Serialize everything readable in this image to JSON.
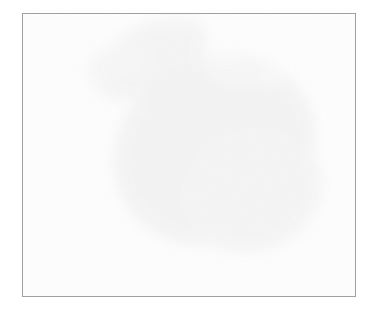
{
  "image": {
    "kind": "micrograph",
    "modality": "brightfield-light-microscopy",
    "stain": "hematoxylin-like grayscale",
    "subject": "epithelial cell cluster (cytology smear)",
    "color_mode": "grayscale",
    "alt_text": "Grayscale light micrograph of a cohesive cluster of epithelial cells with dark round nuclei, oriented diagonally from upper-left to lower-right on a pale empty background.",
    "width_px": 380,
    "height_px": 323
  },
  "frame": {
    "border_color": "#a0a0a0",
    "border_width_px": 1,
    "left_px": 22,
    "top_px": 13,
    "width_px": 334,
    "height_px": 284
  },
  "palette": {
    "page_background": "#ffffff",
    "field_background": "#fdfdfd",
    "haze": "#f2f2f2",
    "cytoplasm_light": "#e4e4e4",
    "cytoplasm_mid": "#c9c9c9",
    "membrane_outline": "#9a9a9a",
    "nucleus_mid": "#8c8c8c",
    "nucleus_dark": "#5e5e5e",
    "nucleus_darkest": "#3a3a3a",
    "speck_black": "#1d1d1d"
  },
  "caption": {
    "line1": "",
    "line2": ""
  },
  "scene": {
    "cluster_orientation": "upper-left to lower-right diagonal",
    "approx_cell_count": 46,
    "free_cells_top_left": 4,
    "notes": "Dense cohesive sheet of polygonal cells; each cell shows one round hyperchromatic nucleus. A short chain of stacked cells trails to the lower left of the mass. Faint granular debris and a small black speck lie near the upper-left free cells."
  },
  "blobs": {
    "haze": [
      {
        "cx": 150,
        "cy": 58,
        "rx": 62,
        "ry": 34,
        "rot": -28,
        "tone": "#f4f4f4"
      },
      {
        "cx": 118,
        "cy": 62,
        "rx": 34,
        "ry": 18,
        "rot": -18,
        "tone": "#f6f6f6"
      },
      {
        "cx": 215,
        "cy": 150,
        "rx": 105,
        "ry": 92,
        "rot": -32,
        "tone": "#f3f3f3"
      },
      {
        "cx": 252,
        "cy": 190,
        "rx": 72,
        "ry": 62,
        "rot": -20,
        "tone": "#f4f4f4"
      },
      {
        "cx": 230,
        "cy": 70,
        "rx": 26,
        "ry": 14,
        "rot": 10,
        "tone": "#f7f7f7"
      },
      {
        "cx": 268,
        "cy": 78,
        "rx": 16,
        "ry": 10,
        "rot": 0,
        "tone": "#f8f8f8"
      }
    ],
    "cells": [
      {
        "cx": 137,
        "cy": 31,
        "rx": 13,
        "ry": 12,
        "rot": 0,
        "cyto": "#dedede",
        "nuc_dx": 0,
        "nuc_dy": 0,
        "nr": 9,
        "nuc": "#8f8f8f",
        "solo": true
      },
      {
        "cx": 153,
        "cy": 62,
        "rx": 14,
        "ry": 13,
        "rot": -12,
        "cyto": "#e0e0e0",
        "nuc_dx": 0,
        "nuc_dy": -1,
        "nr": 9,
        "nuc": "#6f6f6f",
        "solo": true
      },
      {
        "cx": 171,
        "cy": 77,
        "rx": 12,
        "ry": 12,
        "rot": 8,
        "cyto": "#e2e2e2",
        "nuc_dx": -1,
        "nuc_dy": 1,
        "nr": 7,
        "nuc": "#8a8a8a",
        "solo": true
      },
      {
        "cx": 116,
        "cy": 60,
        "rx": 9,
        "ry": 7,
        "rot": -20,
        "cyto": "#ededed",
        "nuc_dx": 0,
        "nuc_dy": 0,
        "nr": 4,
        "nuc": "#b8b8b8",
        "solo": true
      },
      {
        "cx": 185,
        "cy": 93,
        "rx": 15,
        "ry": 14,
        "rot": -16,
        "cyto": "#d8d8d8",
        "nuc_dx": -1,
        "nuc_dy": -1,
        "nr": 8,
        "nuc": "#6a6a6a"
      },
      {
        "cx": 208,
        "cy": 86,
        "rx": 16,
        "ry": 15,
        "rot": 10,
        "cyto": "#dcdcdc",
        "nuc_dx": 1,
        "nuc_dy": 1,
        "nr": 8,
        "nuc": "#636363"
      },
      {
        "cx": 232,
        "cy": 96,
        "rx": 15,
        "ry": 15,
        "rot": -8,
        "cyto": "#dadada",
        "nuc_dx": 0,
        "nuc_dy": 1,
        "nr": 8,
        "nuc": "#5c5c5c"
      },
      {
        "cx": 166,
        "cy": 112,
        "rx": 16,
        "ry": 15,
        "rot": -24,
        "cyto": "#d9d9d9",
        "nuc_dx": -2,
        "nuc_dy": 0,
        "nr": 8,
        "nuc": "#6e6e6e"
      },
      {
        "cx": 191,
        "cy": 115,
        "rx": 16,
        "ry": 16,
        "rot": 6,
        "cyto": "#d5d5d5",
        "nuc_dx": 1,
        "nuc_dy": 0,
        "nr": 9,
        "nuc": "#585858"
      },
      {
        "cx": 215,
        "cy": 112,
        "rx": 15,
        "ry": 15,
        "rot": -6,
        "cyto": "#d9d9d9",
        "nuc_dx": 0,
        "nuc_dy": 1,
        "nr": 8,
        "nuc": "#646464"
      },
      {
        "cx": 240,
        "cy": 118,
        "rx": 16,
        "ry": 15,
        "rot": 14,
        "cyto": "#d7d7d7",
        "nuc_dx": 1,
        "nuc_dy": -1,
        "nr": 8,
        "nuc": "#5a5a5a"
      },
      {
        "cx": 263,
        "cy": 109,
        "rx": 15,
        "ry": 16,
        "rot": -18,
        "cyto": "#dbdbdb",
        "nuc_dx": -1,
        "nuc_dy": 1,
        "nr": 8,
        "nuc": "#636363"
      },
      {
        "cx": 285,
        "cy": 104,
        "rx": 16,
        "ry": 15,
        "rot": 6,
        "cyto": "#d9d9d9",
        "nuc_dx": 0,
        "nuc_dy": 0,
        "nr": 9,
        "nuc": "#555555"
      },
      {
        "cx": 304,
        "cy": 118,
        "rx": 15,
        "ry": 15,
        "rot": -10,
        "cyto": "#dddddd",
        "nuc_dx": 1,
        "nuc_dy": 1,
        "nr": 8,
        "nuc": "#646464"
      },
      {
        "cx": 152,
        "cy": 136,
        "rx": 15,
        "ry": 15,
        "rot": -20,
        "cyto": "#e0e0e0",
        "nuc_dx": -1,
        "nuc_dy": -2,
        "nr": 6,
        "nuc": "#8b8b8b"
      },
      {
        "cx": 176,
        "cy": 139,
        "rx": 16,
        "ry": 15,
        "rot": 4,
        "cyto": "#d6d6d6",
        "nuc_dx": 0,
        "nuc_dy": 1,
        "nr": 9,
        "nuc": "#5b5b5b"
      },
      {
        "cx": 200,
        "cy": 140,
        "rx": 16,
        "ry": 16,
        "rot": -8,
        "cyto": "#d4d4d4",
        "nuc_dx": 1,
        "nuc_dy": 0,
        "nr": 9,
        "nuc": "#525252"
      },
      {
        "cx": 224,
        "cy": 142,
        "rx": 16,
        "ry": 15,
        "rot": 10,
        "cyto": "#d8d8d8",
        "nuc_dx": -1,
        "nuc_dy": 1,
        "nr": 8,
        "nuc": "#5f5f5f"
      },
      {
        "cx": 248,
        "cy": 146,
        "rx": 16,
        "ry": 16,
        "rot": -6,
        "cyto": "#d5d5d5",
        "nuc_dx": 0,
        "nuc_dy": 0,
        "nr": 9,
        "nuc": "#4e4e4e"
      },
      {
        "cx": 272,
        "cy": 140,
        "rx": 15,
        "ry": 15,
        "rot": 16,
        "cyto": "#dbdbdb",
        "nuc_dx": 1,
        "nuc_dy": -1,
        "nr": 8,
        "nuc": "#636363"
      },
      {
        "cx": 295,
        "cy": 145,
        "rx": 16,
        "ry": 16,
        "rot": -12,
        "cyto": "#d9d9d9",
        "nuc_dx": 0,
        "nuc_dy": 1,
        "nr": 9,
        "nuc": "#5a5a5a"
      },
      {
        "cx": 317,
        "cy": 139,
        "rx": 14,
        "ry": 15,
        "rot": 6,
        "cyto": "#dedede",
        "nuc_dx": 0,
        "nuc_dy": 0,
        "nr": 7,
        "nuc": "#6d6d6d"
      },
      {
        "cx": 163,
        "cy": 160,
        "rx": 14,
        "ry": 14,
        "rot": -18,
        "cyto": "#e2e2e2",
        "nuc_dx": -1,
        "nuc_dy": 0,
        "nr": 6,
        "nuc": "#909090"
      },
      {
        "cx": 188,
        "cy": 166,
        "rx": 16,
        "ry": 15,
        "rot": 8,
        "cyto": "#d7d7d7",
        "nuc_dx": 0,
        "nuc_dy": 1,
        "nr": 9,
        "nuc": "#575757"
      },
      {
        "cx": 212,
        "cy": 168,
        "rx": 16,
        "ry": 16,
        "rot": -10,
        "cyto": "#d6d6d6",
        "nuc_dx": 1,
        "nuc_dy": 0,
        "nr": 9,
        "nuc": "#505050"
      },
      {
        "cx": 237,
        "cy": 172,
        "rx": 16,
        "ry": 15,
        "rot": 12,
        "cyto": "#d8d8d8",
        "nuc_dx": -1,
        "nuc_dy": 1,
        "nr": 8,
        "nuc": "#5d5d5d"
      },
      {
        "cx": 262,
        "cy": 170,
        "rx": 16,
        "ry": 16,
        "rot": -8,
        "cyto": "#d4d4d4",
        "nuc_dx": 0,
        "nuc_dy": 0,
        "nr": 9,
        "nuc": "#4a4a4a"
      },
      {
        "cx": 287,
        "cy": 174,
        "rx": 16,
        "ry": 16,
        "rot": 6,
        "cyto": "#d9d9d9",
        "nuc_dx": 1,
        "nuc_dy": 1,
        "nr": 8,
        "nuc": "#5e5e5e"
      },
      {
        "cx": 311,
        "cy": 168,
        "rx": 15,
        "ry": 15,
        "rot": -14,
        "cyto": "#dcdcdc",
        "nuc_dx": 0,
        "nuc_dy": 0,
        "nr": 8,
        "nuc": "#636363"
      },
      {
        "cx": 200,
        "cy": 195,
        "rx": 15,
        "ry": 14,
        "rot": -6,
        "cyto": "#dadada",
        "nuc_dx": 0,
        "nuc_dy": 0,
        "nr": 8,
        "nuc": "#5f5f5f"
      },
      {
        "cx": 226,
        "cy": 198,
        "rx": 15,
        "ry": 15,
        "rot": 10,
        "cyto": "#d7d7d7",
        "nuc_dx": 1,
        "nuc_dy": 1,
        "nr": 8,
        "nuc": "#565656"
      },
      {
        "cx": 252,
        "cy": 200,
        "rx": 16,
        "ry": 16,
        "rot": -12,
        "cyto": "#d5d5d5",
        "nuc_dx": -1,
        "nuc_dy": 0,
        "nr": 9,
        "nuc": "#494949"
      },
      {
        "cx": 278,
        "cy": 200,
        "rx": 16,
        "ry": 16,
        "rot": 8,
        "cyto": "#d8d8d8",
        "nuc_dx": 0,
        "nuc_dy": 1,
        "nr": 9,
        "nuc": "#525252"
      },
      {
        "cx": 303,
        "cy": 196,
        "rx": 15,
        "ry": 16,
        "rot": -10,
        "cyto": "#dadada",
        "nuc_dx": 1,
        "nuc_dy": 0,
        "nr": 8,
        "nuc": "#5b5b5b"
      },
      {
        "cx": 241,
        "cy": 226,
        "rx": 16,
        "ry": 16,
        "rot": -6,
        "cyto": "#dcdcdc",
        "nuc_dx": 0,
        "nuc_dy": -1,
        "nr": 7,
        "nuc": "#6b6b6b"
      },
      {
        "cx": 268,
        "cy": 228,
        "rx": 16,
        "ry": 16,
        "rot": 10,
        "cyto": "#d8d8d8",
        "nuc_dx": 0,
        "nuc_dy": 1,
        "nr": 9,
        "nuc": "#545454"
      },
      {
        "cx": 294,
        "cy": 224,
        "rx": 16,
        "ry": 16,
        "rot": -8,
        "cyto": "#dadada",
        "nuc_dx": 1,
        "nuc_dy": 0,
        "nr": 8,
        "nuc": "#5d5d5d"
      },
      {
        "cx": 316,
        "cy": 210,
        "rx": 14,
        "ry": 15,
        "rot": 6,
        "cyto": "#dedede",
        "nuc_dx": 0,
        "nuc_dy": 0,
        "nr": 7,
        "nuc": "#666666"
      },
      {
        "cx": 213,
        "cy": 213,
        "rx": 14,
        "ry": 9,
        "rot": -4,
        "cyto": "#dcdcdc",
        "nuc_dx": 0,
        "nuc_dy": 0,
        "nr": 6,
        "nuc": "#6a6a6a",
        "chain": true
      },
      {
        "cx": 214,
        "cy": 228,
        "rx": 14,
        "ry": 9,
        "rot": -2,
        "cyto": "#dadada",
        "nuc_dx": 0,
        "nuc_dy": 0,
        "nr": 6,
        "nuc": "#5f5f5f",
        "chain": true
      },
      {
        "cx": 216,
        "cy": 242,
        "rx": 14,
        "ry": 9,
        "rot": 0,
        "cyto": "#d9d9d9",
        "nuc_dx": 0,
        "nuc_dy": 0,
        "nr": 6,
        "nuc": "#585858",
        "chain": true
      },
      {
        "cx": 218,
        "cy": 255,
        "rx": 13,
        "ry": 9,
        "rot": 2,
        "cyto": "#dcdcdc",
        "nuc_dx": 0,
        "nuc_dy": 0,
        "nr": 6,
        "nuc": "#606060",
        "chain": true
      },
      {
        "cx": 152,
        "cy": 108,
        "rx": 11,
        "ry": 12,
        "rot": -20,
        "cyto": "#e6e6e6",
        "nuc_dx": 0,
        "nuc_dy": 0,
        "nr": 4,
        "nuc": "#a8a8a8",
        "pale": true
      },
      {
        "cx": 148,
        "cy": 152,
        "rx": 12,
        "ry": 12,
        "rot": -10,
        "cyto": "#e8e8e8",
        "nuc_dx": 0,
        "nuc_dy": 0,
        "nr": 4,
        "nuc": "#b0b0b0",
        "pale": true
      },
      {
        "cx": 320,
        "cy": 186,
        "rx": 12,
        "ry": 13,
        "rot": 12,
        "cyto": "#e4e4e4",
        "nuc_dx": 0,
        "nuc_dy": 0,
        "nr": 5,
        "nuc": "#9e9e9e",
        "pale": true
      },
      {
        "cx": 240,
        "cy": 248,
        "rx": 13,
        "ry": 13,
        "rot": -6,
        "cyto": "#e6e6e6",
        "nuc_dx": 0,
        "nuc_dy": 0,
        "nr": 5,
        "nuc": "#a2a2a2",
        "pale": true
      }
    ],
    "specks": [
      {
        "cx": 141,
        "cy": 56,
        "r": 2.0,
        "tone": "#1d1d1d"
      },
      {
        "cx": 179,
        "cy": 34,
        "r": 1.4,
        "tone": "#9c9c9c"
      },
      {
        "cx": 196,
        "cy": 27,
        "r": 1.0,
        "tone": "#b4b4b4"
      },
      {
        "cx": 221,
        "cy": 62,
        "r": 1.2,
        "tone": "#b8b8b8"
      },
      {
        "cx": 265,
        "cy": 273,
        "r": 1.1,
        "tone": "#c6c6c6"
      },
      {
        "cx": 276,
        "cy": 272,
        "r": 0.9,
        "tone": "#cdcdcd"
      },
      {
        "cx": 112,
        "cy": 72,
        "r": 1.3,
        "tone": "#c0c0c0"
      }
    ],
    "debris_wisps": [
      {
        "cx": 108,
        "cy": 66,
        "rx": 26,
        "ry": 9,
        "rot": -14,
        "tone": "#e6e6e6"
      },
      {
        "cx": 126,
        "cy": 72,
        "rx": 18,
        "ry": 7,
        "rot": -8,
        "tone": "#e0e0e0"
      },
      {
        "cx": 96,
        "cy": 62,
        "rx": 14,
        "ry": 6,
        "rot": -22,
        "tone": "#ececec"
      }
    ]
  }
}
